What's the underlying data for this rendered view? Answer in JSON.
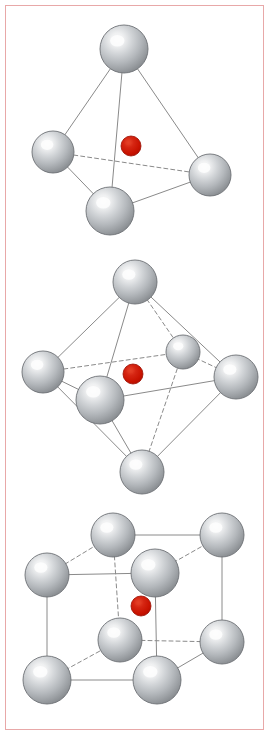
{
  "figure": {
    "title": "Coordination geometries of a central atom surrounded by ligand atoms",
    "background_color": "#ffffff",
    "border_color": "#e8a8a8",
    "width": 270,
    "height": 736,
    "frame": {
      "x": 5,
      "y": 5,
      "width": 259,
      "height": 725,
      "stroke_width": 1
    }
  },
  "style": {
    "ligand_highlight_color": "#f5f5f5",
    "ligand_mid_color": "#b9bdc1",
    "ligand_edge_color": "#8b8f93",
    "ligand_outline_color": "#6d7175",
    "center_atom_color": "#cc1100",
    "center_atom_highlight_color": "#e23a22",
    "center_atom_outline_color": "#9a0c00",
    "bond_color": "#8a8a8a",
    "bond_width": 1,
    "hidden_bond_dash": "4 3",
    "highlight_offset_x": "36%",
    "highlight_offset_y": "30%"
  },
  "panels": [
    {
      "id": "tetrahedral",
      "name": "tetrahedral-coordination",
      "label": "Tetrahedral",
      "coordination_number": 4,
      "ligand_count": 4,
      "center_atom": {
        "cx": 131,
        "cy": 146,
        "r": 10
      },
      "ligands": [
        {
          "id": "apex",
          "cx": 124,
          "cy": 49,
          "r": 24,
          "depth": "front"
        },
        {
          "id": "left",
          "cx": 53,
          "cy": 152,
          "r": 21,
          "depth": "back"
        },
        {
          "id": "right",
          "cx": 210,
          "cy": 175,
          "r": 21,
          "depth": "back"
        },
        {
          "id": "front-bottom",
          "cx": 110,
          "cy": 211,
          "r": 24,
          "depth": "front"
        }
      ],
      "bonds": [
        {
          "from": "apex",
          "to": "left",
          "hidden": false
        },
        {
          "from": "apex",
          "to": "right",
          "hidden": false
        },
        {
          "from": "apex",
          "to": "front-bottom",
          "hidden": false
        },
        {
          "from": "left",
          "to": "front-bottom",
          "hidden": false
        },
        {
          "from": "right",
          "to": "front-bottom",
          "hidden": false
        },
        {
          "from": "left",
          "to": "right",
          "hidden": true
        }
      ]
    },
    {
      "id": "octahedral",
      "name": "octahedral-coordination",
      "label": "Octahedral",
      "coordination_number": 6,
      "ligand_count": 6,
      "center_atom": {
        "cx": 133,
        "cy": 374,
        "r": 10
      },
      "ligands": [
        {
          "id": "top",
          "cx": 135,
          "cy": 282,
          "r": 22,
          "depth": "front"
        },
        {
          "id": "left",
          "cx": 43,
          "cy": 372,
          "r": 21,
          "depth": "back"
        },
        {
          "id": "right",
          "cx": 236,
          "cy": 377,
          "r": 22,
          "depth": "back"
        },
        {
          "id": "front",
          "cx": 100,
          "cy": 400,
          "r": 24,
          "depth": "front"
        },
        {
          "id": "back",
          "cx": 183,
          "cy": 352,
          "r": 17,
          "depth": "back"
        },
        {
          "id": "bottom",
          "cx": 142,
          "cy": 472,
          "r": 22,
          "depth": "front"
        }
      ],
      "bonds": [
        {
          "from": "top",
          "to": "left",
          "hidden": false
        },
        {
          "from": "top",
          "to": "front",
          "hidden": false
        },
        {
          "from": "top",
          "to": "right",
          "hidden": false
        },
        {
          "from": "top",
          "to": "back",
          "hidden": true
        },
        {
          "from": "left",
          "to": "front",
          "hidden": false
        },
        {
          "from": "front",
          "to": "right",
          "hidden": false
        },
        {
          "from": "left",
          "to": "back",
          "hidden": true
        },
        {
          "from": "back",
          "to": "right",
          "hidden": true
        },
        {
          "from": "bottom",
          "to": "left",
          "hidden": false
        },
        {
          "from": "bottom",
          "to": "front",
          "hidden": false
        },
        {
          "from": "bottom",
          "to": "right",
          "hidden": false
        },
        {
          "from": "bottom",
          "to": "back",
          "hidden": true
        }
      ]
    },
    {
      "id": "cubic",
      "name": "cubic-coordination",
      "label": "Cubic",
      "coordination_number": 8,
      "ligand_count": 8,
      "center_atom": {
        "cx": 141,
        "cy": 606,
        "r": 10
      },
      "ligands": [
        {
          "id": "back-top-left",
          "cx": 113,
          "cy": 535,
          "r": 22,
          "depth": "back"
        },
        {
          "id": "back-top-right",
          "cx": 222,
          "cy": 535,
          "r": 22,
          "depth": "back"
        },
        {
          "id": "front-top-left",
          "cx": 47,
          "cy": 575,
          "r": 22,
          "depth": "front"
        },
        {
          "id": "front-top-right",
          "cx": 155,
          "cy": 573,
          "r": 24,
          "depth": "front"
        },
        {
          "id": "back-bottom-left",
          "cx": 120,
          "cy": 640,
          "r": 22,
          "depth": "back"
        },
        {
          "id": "back-bottom-right",
          "cx": 222,
          "cy": 642,
          "r": 22,
          "depth": "back"
        },
        {
          "id": "front-bottom-left",
          "cx": 47,
          "cy": 680,
          "r": 24,
          "depth": "front"
        },
        {
          "id": "front-bottom-right",
          "cx": 157,
          "cy": 680,
          "r": 24,
          "depth": "front"
        }
      ],
      "bonds": [
        {
          "from": "front-top-left",
          "to": "front-top-right",
          "hidden": false
        },
        {
          "from": "front-top-left",
          "to": "front-bottom-left",
          "hidden": false
        },
        {
          "from": "front-top-right",
          "to": "front-bottom-right",
          "hidden": false
        },
        {
          "from": "front-bottom-left",
          "to": "front-bottom-right",
          "hidden": false
        },
        {
          "from": "back-top-left",
          "to": "back-top-right",
          "hidden": false
        },
        {
          "from": "back-top-left",
          "to": "back-bottom-left",
          "hidden": true
        },
        {
          "from": "back-top-right",
          "to": "back-bottom-right",
          "hidden": false
        },
        {
          "from": "back-bottom-left",
          "to": "back-bottom-right",
          "hidden": true
        },
        {
          "from": "front-top-left",
          "to": "back-top-left",
          "hidden": true
        },
        {
          "from": "front-top-right",
          "to": "back-top-right",
          "hidden": true
        },
        {
          "from": "front-bottom-left",
          "to": "back-bottom-left",
          "hidden": true
        },
        {
          "from": "front-bottom-right",
          "to": "back-bottom-right",
          "hidden": false
        }
      ]
    }
  ]
}
